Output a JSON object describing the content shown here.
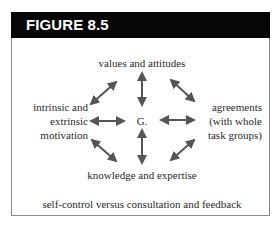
{
  "figure": {
    "title": "FIGURE 8.5",
    "center_node": "G.",
    "nodes": {
      "top": "values and attitudes",
      "left": [
        "intrinsic and",
        "extrinsic",
        "motivation"
      ],
      "right": [
        "agreements",
        "(with whole",
        "task groups)"
      ],
      "bottom": "knowledge and expertise"
    },
    "caption": "self-control versus consultation and feedback",
    "connections": [
      {
        "from": "G.",
        "to": "values and attitudes",
        "type": "double-arrow"
      },
      {
        "from": "G.",
        "to": "knowledge and expertise",
        "type": "double-arrow"
      },
      {
        "from": "G.",
        "to": "intrinsic and extrinsic motivation",
        "type": "double-arrow"
      },
      {
        "from": "G.",
        "to": "agreements (with whole task groups)",
        "type": "double-arrow"
      },
      {
        "from": "values and attitudes",
        "to": "intrinsic and extrinsic motivation",
        "type": "double-arrow"
      },
      {
        "from": "values and attitudes",
        "to": "agreements (with whole task groups)",
        "type": "double-arrow"
      },
      {
        "from": "knowledge and expertise",
        "to": "intrinsic and extrinsic motivation",
        "type": "double-arrow"
      },
      {
        "from": "knowledge and expertise",
        "to": "agreements (with whole task groups)",
        "type": "double-arrow"
      }
    ],
    "colors": {
      "header_bg": "#060606",
      "header_text": "#ffffff",
      "arrow": "#555555",
      "text": "#2a2a2a",
      "border": "#8a8a8a"
    }
  }
}
